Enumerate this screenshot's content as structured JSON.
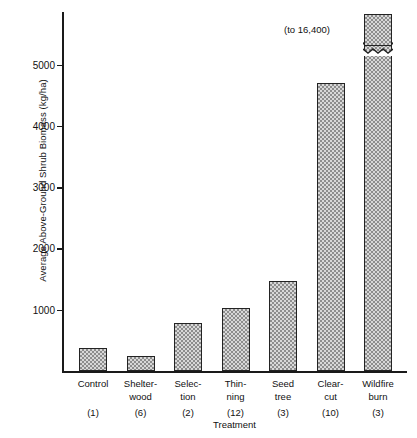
{
  "chart_data": {
    "type": "bar",
    "title": "",
    "xlabel": "Treatment",
    "ylabel": "Average Above-Ground Shrub Biomass (kg/ha)",
    "categories": [
      "Control",
      "Shelter-\nwood",
      "Selec-\ntion",
      "Thin-\nning",
      "Seed\ntree",
      "Clear-\ncut",
      "Wildfire\nburn"
    ],
    "values": [
      380,
      245,
      780,
      1020,
      1470,
      4700,
      16400
    ],
    "sample_counts": [
      1,
      6,
      2,
      12,
      3,
      10,
      3
    ],
    "ylim": [
      0,
      5900
    ],
    "yticks": [
      1000,
      2000,
      3000,
      4000,
      5000
    ],
    "ytick_labels": [
      "1000",
      "2000",
      "3000",
      "4000",
      "5000"
    ],
    "grid": false,
    "legend": null,
    "annotations": [
      {
        "text": "(to 16,400)",
        "target_category": "Wildfire\nburn",
        "note": "axis break - wildfire burn bar is truncated"
      }
    ],
    "axis_break": {
      "present": true,
      "category": "Wildfire\nburn",
      "true_value": 16400
    }
  },
  "axis": {
    "y_title": "Average Above-Ground Shrub Biomass (kg/ha)",
    "x_title": "Treatment",
    "ticks": [
      {
        "label": "5000",
        "value": 5000
      },
      {
        "label": "4000",
        "value": 4000
      },
      {
        "label": "3000",
        "value": 3000
      },
      {
        "label": "2000",
        "value": 2000
      },
      {
        "label": "1000",
        "value": 1000
      }
    ]
  },
  "bars": [
    {
      "name": "control",
      "line1": "Control",
      "line2": "",
      "count": "(1)",
      "value": 380
    },
    {
      "name": "shelterwood",
      "line1": "Shelter-",
      "line2": "wood",
      "count": "(6)",
      "value": 245
    },
    {
      "name": "selection",
      "line1": "Selec-",
      "line2": "tion",
      "count": "(2)",
      "value": 780
    },
    {
      "name": "thinning",
      "line1": "Thin-",
      "line2": "ning",
      "count": "(12)",
      "value": 1020
    },
    {
      "name": "seedtree",
      "line1": "Seed",
      "line2": "tree",
      "count": "(3)",
      "value": 1470
    },
    {
      "name": "clearcut",
      "line1": "Clear-",
      "line2": "cut",
      "count": "(10)",
      "value": 4700
    },
    {
      "name": "wildfireburn",
      "line1": "Wildfire",
      "line2": "burn",
      "count": "(3)",
      "value": 16400
    }
  ],
  "annotation": {
    "break_note": "(to 16,400)"
  },
  "colors": {
    "bar_border": "#232323",
    "bar_fill_light": "#d8d8d8",
    "bar_fill_dark": "#8d8d8d",
    "axis": "#1a1a1a",
    "text": "#111111",
    "background": "#ffffff"
  }
}
